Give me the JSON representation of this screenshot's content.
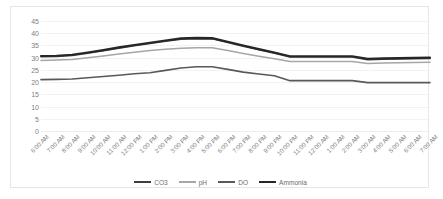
{
  "chart_data": {
    "type": "line",
    "title": "",
    "xlabel": "",
    "ylabel": "",
    "ylim": [
      0,
      45
    ],
    "yticks": [
      0,
      5,
      10,
      15,
      20,
      25,
      30,
      35,
      40,
      45
    ],
    "grid": true,
    "legend_position": "bottom",
    "categories": [
      "6:00 AM",
      "7:00 AM",
      "8:00 AM",
      "9:00 AM",
      "10:00 AM",
      "11:00 AM",
      "12:00 PM",
      "1:00 PM",
      "2:00 PM",
      "3:00 PM",
      "4:00 PM",
      "5:00 PM",
      "6:00 PM",
      "7:00 PM",
      "8:00 PM",
      "9:00 PM",
      "10:00 PM",
      "11:00 PM",
      "12:00 AM",
      "1:00 AM",
      "2:00 AM",
      "3:00 AM",
      "4:00 AM",
      "5:00 AM",
      "6:00 AM",
      "7:00 AM"
    ],
    "series": [
      {
        "name": "CO3",
        "color": "#3f3f3f",
        "width": 1.6,
        "values": [
          30.4,
          30.5,
          30.9,
          31.8,
          32.8,
          33.9,
          34.9,
          35.8,
          36.7,
          37.6,
          37.8,
          37.7,
          36.2,
          34.7,
          33.2,
          31.8,
          30.3,
          30.3,
          30.3,
          30.3,
          30.3,
          29.2,
          29.4,
          29.5,
          29.6,
          29.7
        ]
      },
      {
        "name": "pH",
        "color": "#a6a6a6",
        "width": 1.5,
        "values": [
          28.8,
          29.0,
          29.3,
          30.0,
          30.7,
          31.5,
          32.2,
          32.9,
          33.4,
          33.9,
          34.1,
          34.1,
          32.9,
          31.7,
          30.6,
          29.6,
          28.4,
          28.4,
          28.4,
          28.4,
          28.4,
          27.6,
          27.8,
          27.9,
          28.0,
          28.1
        ]
      },
      {
        "name": "DO",
        "color": "#595959",
        "width": 1.6,
        "values": [
          21.0,
          21.1,
          21.3,
          21.8,
          22.3,
          22.8,
          23.4,
          23.8,
          24.8,
          25.8,
          26.3,
          26.3,
          25.2,
          24.1,
          23.3,
          22.6,
          20.6,
          20.6,
          20.6,
          20.6,
          20.6,
          19.8,
          19.8,
          19.8,
          19.8,
          19.8
        ]
      },
      {
        "name": "Ammonia",
        "color": "#262626",
        "width": 2.1,
        "values": [
          30.7,
          30.8,
          31.2,
          32.1,
          33.1,
          34.2,
          35.2,
          36.1,
          37.0,
          37.9,
          38.1,
          38.0,
          36.5,
          35.0,
          33.5,
          32.1,
          30.6,
          30.6,
          30.6,
          30.6,
          30.6,
          29.5,
          29.7,
          29.8,
          29.9,
          30.0
        ]
      }
    ]
  },
  "legend": {
    "items": [
      {
        "label": "CO3"
      },
      {
        "label": "pH"
      },
      {
        "label": "DO"
      },
      {
        "label": "Ammonia"
      }
    ]
  }
}
